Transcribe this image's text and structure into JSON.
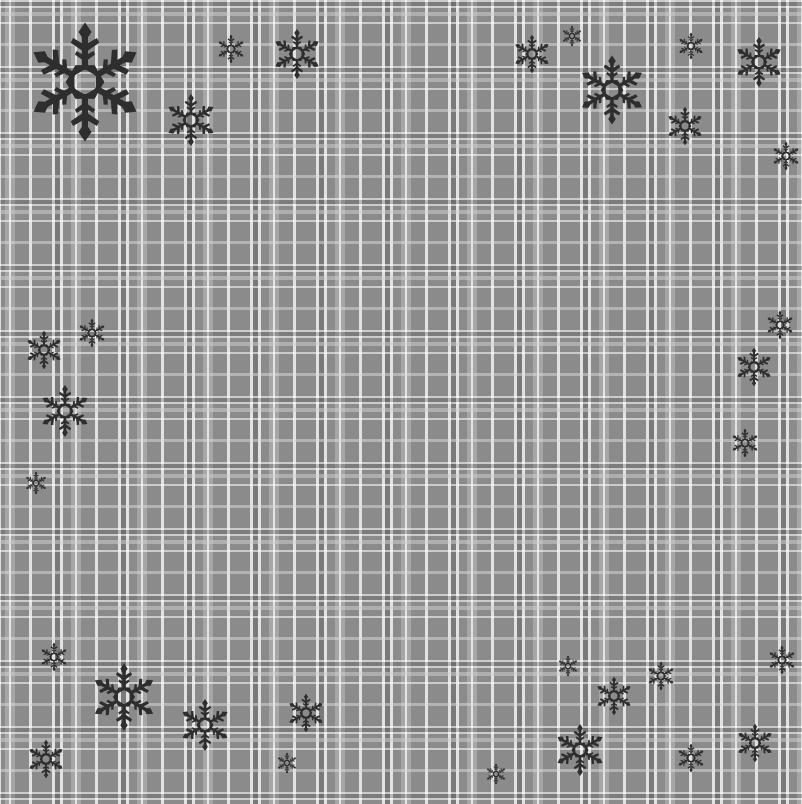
{
  "scene": {
    "description": "Gray plaid background with scattered dark snowflakes",
    "colors": {
      "base": "#8b8b8b",
      "light_band": "#a8a8a8",
      "white_line": "#f5f5f5",
      "dark_band": "#6e6e6e",
      "snowflake": "#2e2e2e"
    },
    "plaid_period_px": 66
  },
  "snowflakes": [
    {
      "x": 85,
      "y": 82,
      "r": 62
    },
    {
      "x": 231,
      "y": 49,
      "r": 15
    },
    {
      "x": 297,
      "y": 54,
      "r": 26
    },
    {
      "x": 191,
      "y": 120,
      "r": 27
    },
    {
      "x": 532,
      "y": 54,
      "r": 20
    },
    {
      "x": 572,
      "y": 36,
      "r": 11
    },
    {
      "x": 612,
      "y": 90,
      "r": 36
    },
    {
      "x": 691,
      "y": 46,
      "r": 14
    },
    {
      "x": 685,
      "y": 126,
      "r": 20
    },
    {
      "x": 759,
      "y": 62,
      "r": 26
    },
    {
      "x": 786,
      "y": 156,
      "r": 15
    },
    {
      "x": 44,
      "y": 350,
      "r": 20
    },
    {
      "x": 92,
      "y": 333,
      "r": 15
    },
    {
      "x": 65,
      "y": 411,
      "r": 27
    },
    {
      "x": 36,
      "y": 483,
      "r": 12
    },
    {
      "x": 780,
      "y": 325,
      "r": 15
    },
    {
      "x": 754,
      "y": 367,
      "r": 20
    },
    {
      "x": 745,
      "y": 443,
      "r": 15
    },
    {
      "x": 54,
      "y": 657,
      "r": 15
    },
    {
      "x": 124,
      "y": 697,
      "r": 35
    },
    {
      "x": 205,
      "y": 725,
      "r": 27
    },
    {
      "x": 306,
      "y": 713,
      "r": 20
    },
    {
      "x": 46,
      "y": 759,
      "r": 20
    },
    {
      "x": 287,
      "y": 763,
      "r": 11
    },
    {
      "x": 568,
      "y": 666,
      "r": 11
    },
    {
      "x": 614,
      "y": 696,
      "r": 20
    },
    {
      "x": 661,
      "y": 676,
      "r": 15
    },
    {
      "x": 580,
      "y": 750,
      "r": 27
    },
    {
      "x": 496,
      "y": 774,
      "r": 11
    },
    {
      "x": 691,
      "y": 758,
      "r": 15
    },
    {
      "x": 755,
      "y": 743,
      "r": 20
    },
    {
      "x": 782,
      "y": 660,
      "r": 15
    }
  ]
}
